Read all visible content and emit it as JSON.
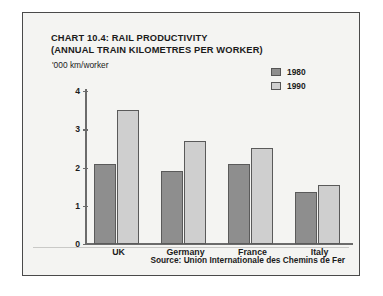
{
  "chart_data": {
    "type": "bar",
    "title": "CHART 10.4: RAIL PRODUCTIVITY (ANNUAL TRAIN KILOMETRES PER WORKER)",
    "title_lines": [
      "CHART 10.4: RAIL PRODUCTIVITY",
      "(ANNUAL TRAIN KILOMETRES PER WORKER)"
    ],
    "subtitle": "",
    "xlabel": "",
    "ylabel": "'000 km/worker",
    "ylim": [
      0,
      4
    ],
    "yticks": [
      0,
      1,
      2,
      3,
      4
    ],
    "ytick_labels": [
      "0",
      "1",
      "2",
      "3",
      "4"
    ],
    "grid": false,
    "legend_position": "top-right",
    "categories": [
      "UK",
      "Germany",
      "France",
      "Italy"
    ],
    "series": [
      {
        "name": "1980",
        "color": "#8e8e8e",
        "values": [
          2.1,
          1.9,
          2.1,
          1.35
        ]
      },
      {
        "name": "1990",
        "color": "#cfcfcf",
        "values": [
          3.5,
          2.7,
          2.5,
          1.55
        ]
      }
    ],
    "annotations": [
      "Source: Union Internationale des Chemins de Fer"
    ]
  },
  "figure": {
    "source_note": "Source: Union Internationale des Chemins de Fer",
    "frame_color": "#4a4a4a",
    "background_color": "#f4f4f2",
    "axis_color": "#6b6b6b",
    "text_color": "#1b1b1b"
  }
}
